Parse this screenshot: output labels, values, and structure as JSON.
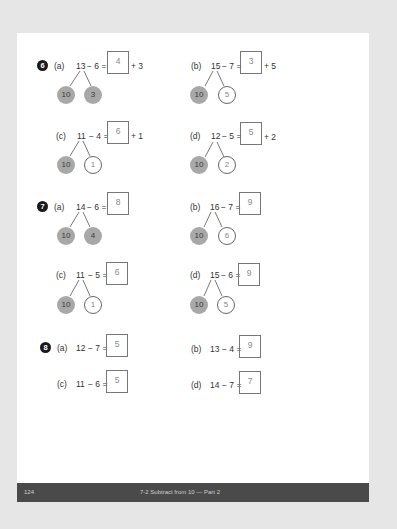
{
  "page": {
    "number": "124",
    "footer_title": "7-2 Subtract from 10 — Part 2"
  },
  "problems": [
    {
      "number": "6",
      "items": [
        {
          "label": "(a)",
          "first": "13",
          "expr": "− 6 =",
          "answer": "4",
          "addend": "+ 3",
          "bond": {
            "left": "10",
            "right": "3",
            "right_filled": true
          }
        },
        {
          "label": "(b)",
          "first": "15",
          "expr": "− 7 =",
          "answer": "3",
          "addend": "+ 5",
          "bond": {
            "left": "10",
            "right": "5",
            "right_filled": false
          }
        },
        {
          "label": "(c)",
          "first": "11",
          "expr": "− 4 =",
          "answer": "6",
          "addend": "+ 1",
          "bond": {
            "left": "10",
            "right": "1",
            "right_filled": false
          }
        },
        {
          "label": "(d)",
          "first": "12",
          "expr": "− 5 =",
          "answer": "5",
          "addend": "+ 2",
          "bond": {
            "left": "10",
            "right": "2",
            "right_filled": false
          }
        }
      ]
    },
    {
      "number": "7",
      "items": [
        {
          "label": "(a)",
          "first": "14",
          "expr": "− 6 =",
          "answer": "8",
          "bond": {
            "left": "10",
            "right": "4",
            "right_filled": true
          }
        },
        {
          "label": "(b)",
          "first": "16",
          "expr": "− 7 =",
          "answer": "9",
          "bond": {
            "left": "10",
            "right": "6",
            "right_filled": false
          }
        },
        {
          "label": "(c)",
          "first": "11",
          "expr": "− 5 =",
          "answer": "6",
          "bond": {
            "left": "10",
            "right": "1",
            "right_filled": false
          }
        },
        {
          "label": "(d)",
          "first": "15",
          "expr": "− 6 =",
          "answer": "9",
          "bond": {
            "left": "10",
            "right": "5",
            "right_filled": false
          }
        }
      ]
    },
    {
      "number": "8",
      "items": [
        {
          "label": "(a)",
          "first": "12",
          "expr": "− 7 =",
          "answer": "5"
        },
        {
          "label": "(b)",
          "first": "13",
          "expr": "− 4 =",
          "answer": "9"
        },
        {
          "label": "(c)",
          "first": "11",
          "expr": "− 6 =",
          "answer": "5"
        },
        {
          "label": "(d)",
          "first": "14",
          "expr": "− 7 =",
          "answer": "7"
        }
      ]
    }
  ],
  "colors": {
    "background": "#e6e6e6",
    "page": "#ffffff",
    "footer_bar": "#4a4a4a",
    "filled_circle": "#a8a8a8",
    "badge": "#1a1a1a"
  }
}
